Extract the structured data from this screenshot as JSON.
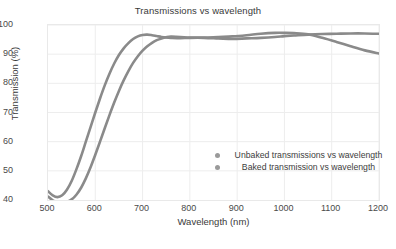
{
  "chart_data": {
    "type": "line",
    "title": "Transmissions vs wavelength",
    "xlabel": "Wavelength (nm)",
    "ylabel": "Transmission (%)",
    "xlim": [
      500,
      1200
    ],
    "ylim": [
      40,
      100
    ],
    "xticks": [
      500,
      600,
      700,
      800,
      900,
      1000,
      1100,
      1200
    ],
    "yticks": [
      40,
      50,
      60,
      70,
      80,
      90,
      100
    ],
    "grid": true,
    "legend_position": "lower-right-inside",
    "line_color": "#8a8a8a",
    "series": [
      {
        "name": "Unbaked transmissions vs wavelength",
        "color": "#8a8a8a",
        "x": [
          500,
          510,
          520,
          530,
          540,
          550,
          560,
          570,
          580,
          590,
          600,
          610,
          620,
          630,
          640,
          650,
          660,
          670,
          680,
          690,
          700,
          710,
          720,
          730,
          740,
          750,
          760,
          780,
          800,
          830,
          860,
          890,
          920,
          950,
          980,
          1000,
          1020,
          1050,
          1080,
          1110,
          1140,
          1170,
          1200
        ],
        "y": [
          43.0,
          41.6,
          41.0,
          41.6,
          43.5,
          46.5,
          50.5,
          55.0,
          60.0,
          65.0,
          70.0,
          74.8,
          79.3,
          83.3,
          86.8,
          89.7,
          92.0,
          93.8,
          95.2,
          96.1,
          96.6,
          96.7,
          96.5,
          96.2,
          95.9,
          95.7,
          95.6,
          95.5,
          95.6,
          95.6,
          95.4,
          95.2,
          95.4,
          95.6,
          95.9,
          96.2,
          96.4,
          96.7,
          96.9,
          97.0,
          97.1,
          97.1,
          97.0
        ]
      },
      {
        "name": "Baked transmission vs wavelength",
        "color": "#8a8a8a",
        "x": [
          500,
          510,
          520,
          530,
          540,
          550,
          560,
          570,
          580,
          590,
          600,
          610,
          620,
          630,
          640,
          650,
          660,
          670,
          680,
          690,
          700,
          710,
          720,
          730,
          740,
          750,
          760,
          780,
          800,
          830,
          860,
          890,
          920,
          950,
          980,
          1000,
          1020,
          1050,
          1080,
          1110,
          1140,
          1170,
          1200
        ],
        "y": [
          41.2,
          39.9,
          39.3,
          39.2,
          39.4,
          40.2,
          41.8,
          44.2,
          47.4,
          51.2,
          55.5,
          60.0,
          64.6,
          69.1,
          73.4,
          77.4,
          81.0,
          84.2,
          87.0,
          89.3,
          91.2,
          92.7,
          93.9,
          94.8,
          95.4,
          95.8,
          96.0,
          95.9,
          95.7,
          95.7,
          95.9,
          96.1,
          96.5,
          97.0,
          97.3,
          97.3,
          97.2,
          96.8,
          95.6,
          94.2,
          92.7,
          91.3,
          90.2
        ]
      }
    ]
  },
  "legend": {
    "items": [
      {
        "label": "Unbaked transmissions vs wavelength"
      },
      {
        "label": "Baked transmission vs wavelength"
      }
    ]
  }
}
